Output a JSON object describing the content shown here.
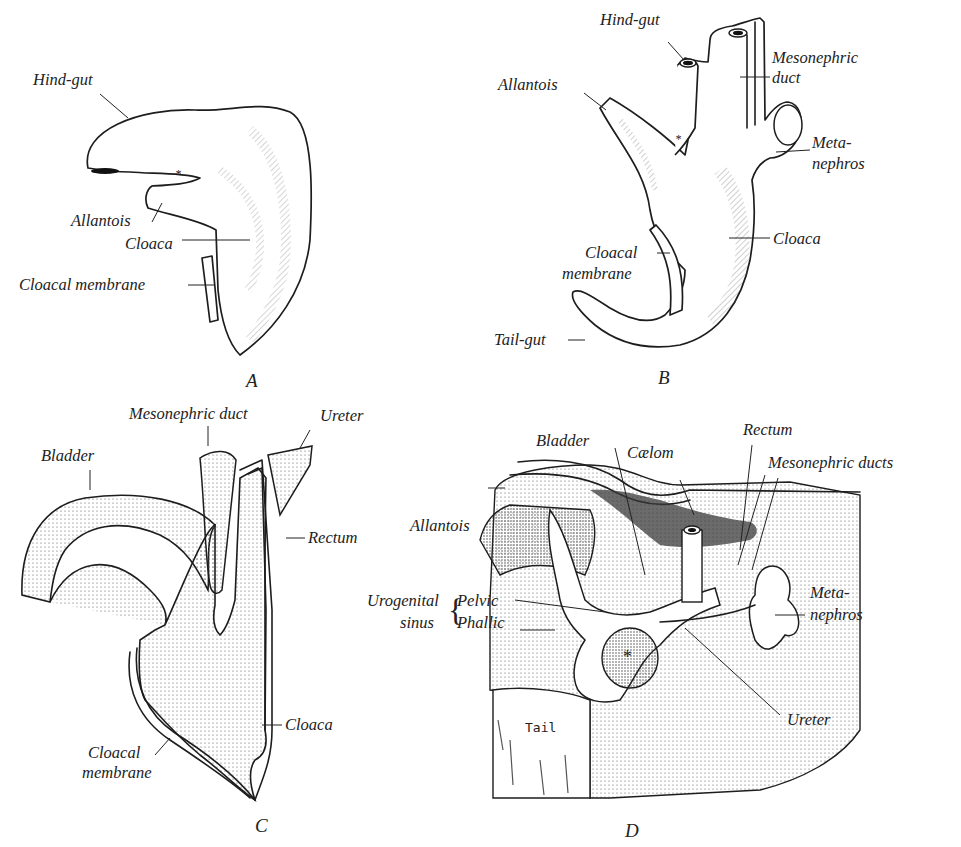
{
  "figure": {
    "panels": [
      {
        "id": "A",
        "label": "A",
        "annotations": {
          "hind_gut": "Hind-gut",
          "allantois": "Allantois",
          "cloaca": "Cloaca",
          "cloacal_membrane": "Cloacal membrane",
          "asterisk": "*"
        }
      },
      {
        "id": "B",
        "label": "B",
        "annotations": {
          "hind_gut": "Hind-gut",
          "allantois": "Allantois",
          "mesonephric_duct_1": "Mesonephric",
          "mesonephric_duct_2": "duct",
          "metanephros_1": "Meta-",
          "metanephros_2": "nephros",
          "cloaca": "Cloaca",
          "cloacal_membrane_1": "Cloacal",
          "cloacal_membrane_2": "membrane",
          "tail_gut": "Tail-gut",
          "asterisk": "*"
        }
      },
      {
        "id": "C",
        "label": "C",
        "annotations": {
          "mesonephric_duct": "Mesonephric duct",
          "ureter": "Ureter",
          "bladder": "Bladder",
          "rectum": "Rectum",
          "cloaca": "Cloaca",
          "cloacal_membrane_1": "Cloacal",
          "cloacal_membrane_2": "membrane"
        }
      },
      {
        "id": "D",
        "label": "D",
        "annotations": {
          "bladder": "Bladder",
          "coelom": "Cælom",
          "rectum": "Rectum",
          "mesonephric_ducts": "Mesonephric ducts",
          "allantois": "Allantois",
          "urogenital": "Urogenital",
          "sinus": "sinus",
          "pelvic": "Pelvic",
          "phallic": "Phallic",
          "metanephros_1": "Meta-",
          "metanephros_2": "nephros",
          "ureter": "Ureter",
          "tail": "Tail",
          "asterisk": "*"
        }
      }
    ]
  }
}
